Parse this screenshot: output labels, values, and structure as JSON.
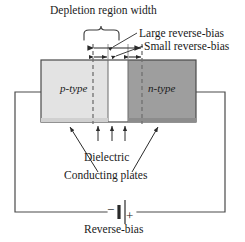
{
  "figure": {
    "title": "Depletion region width",
    "caption": "Reverse-bias",
    "labels": {
      "large_reverse_bias": "Large reverse-bias",
      "small_reverse_bias": "Small reverse-bias",
      "p_type": "p-type",
      "n_type": "n-type",
      "dielectric": "Dielectric",
      "conducting_plates": "Conducting plates",
      "battery_negative": "−",
      "battery_positive": "+"
    },
    "colors": {
      "stroke": "#4a4a4a",
      "text": "#1a1a1a",
      "p_type_fill": "#e3e3e3",
      "n_type_fill": "#9e9e9e",
      "plate_left_fill": "#d0d0d0",
      "plate_right_fill": "#8c8c8c",
      "gap_fill": "#ffffff",
      "dashed_stroke": "#707070"
    },
    "geometry": {
      "block_left": 41,
      "block_right": 196,
      "block_top": 60,
      "block_bottom": 122,
      "junction_left": 108,
      "junction_right": 128,
      "dash_left_x": 93,
      "dash_right_x": 142,
      "wire_left_x": 15,
      "wire_right_x": 225,
      "wire_bottom_y": 212,
      "battery_x": 122
    }
  }
}
